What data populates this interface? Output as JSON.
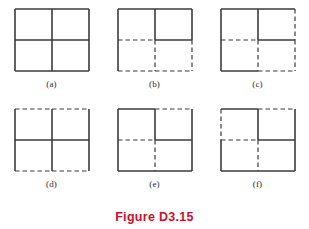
{
  "figure": {
    "caption": "Figure D3.15",
    "caption_color": "#c8102e",
    "line_color": "#3b3b3b",
    "background_color": "#ffffff",
    "panels": [
      {
        "label": "(a)",
        "name": "panel-a",
        "segments": {
          "top_left": "solid",
          "top_right": "solid",
          "bottom_left": "solid",
          "bottom_right": "solid",
          "left_top": "solid",
          "left_bottom": "solid",
          "right_top": "solid",
          "right_bottom": "solid",
          "mid_h_left": "solid",
          "mid_h_right": "solid",
          "mid_v_top": "solid",
          "mid_v_bottom": "solid"
        }
      },
      {
        "label": "(b)",
        "name": "panel-b",
        "segments": {
          "top_left": "solid",
          "top_right": "solid",
          "bottom_left": "dashed",
          "bottom_right": "dashed",
          "left_top": "solid",
          "left_bottom": "solid",
          "right_top": "solid",
          "right_bottom": "dashed",
          "mid_h_left": "dashed",
          "mid_h_right": "solid",
          "mid_v_top": "solid",
          "mid_v_bottom": "dashed"
        }
      },
      {
        "label": "(c)",
        "name": "panel-c",
        "segments": {
          "top_left": "solid",
          "top_right": "solid",
          "bottom_left": "solid",
          "bottom_right": "dashed",
          "left_top": "solid",
          "left_bottom": "solid",
          "right_top": "dashed",
          "right_bottom": "dashed",
          "mid_h_left": "dashed",
          "mid_h_right": "solid",
          "mid_v_top": "solid",
          "mid_v_bottom": "dashed"
        }
      },
      {
        "label": "(d)",
        "name": "panel-d",
        "segments": {
          "top_left": "dashed",
          "top_right": "dashed",
          "bottom_left": "dashed",
          "bottom_right": "dashed",
          "left_top": "solid",
          "left_bottom": "solid",
          "right_top": "solid",
          "right_bottom": "solid",
          "mid_h_left": "solid",
          "mid_h_right": "solid",
          "mid_v_top": "solid",
          "mid_v_bottom": "solid"
        }
      },
      {
        "label": "(e)",
        "name": "panel-e",
        "segments": {
          "top_left": "solid",
          "top_right": "dashed",
          "bottom_left": "solid",
          "bottom_right": "solid",
          "left_top": "solid",
          "left_bottom": "solid",
          "right_top": "solid",
          "right_bottom": "solid",
          "mid_h_left": "dashed",
          "mid_h_right": "solid",
          "mid_v_top": "solid",
          "mid_v_bottom": "dashed"
        }
      },
      {
        "label": "(f)",
        "name": "panel-f",
        "segments": {
          "top_left": "solid",
          "top_right": "dashed",
          "bottom_left": "solid",
          "bottom_right": "solid",
          "left_top": "dashed",
          "left_bottom": "solid",
          "right_top": "solid",
          "right_bottom": "solid",
          "mid_h_left": "dashed",
          "mid_h_right": "solid",
          "mid_v_top": "solid",
          "mid_v_bottom": "dashed"
        }
      }
    ]
  }
}
